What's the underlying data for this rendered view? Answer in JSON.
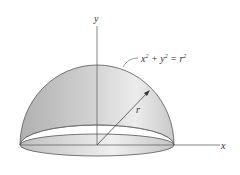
{
  "diagram": {
    "axes": {
      "y_label": "y",
      "x_label": "x"
    },
    "equation": {
      "base": "x",
      "sup1": "2",
      "plus": " + y",
      "sup2": "2",
      "eq": " = r",
      "sup3": "2"
    },
    "radius_label": "r",
    "colors": {
      "surface_light": "#e8e8e8",
      "surface_dark": "#b4b4b4",
      "stroke": "#555555",
      "axis": "#666666"
    }
  }
}
